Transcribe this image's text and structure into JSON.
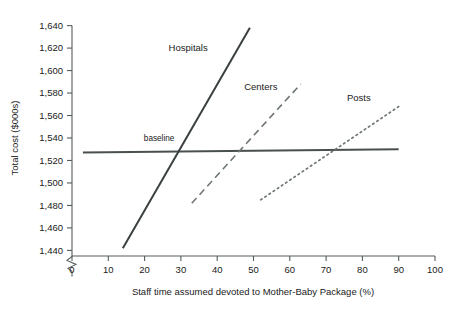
{
  "chart_data": {
    "type": "line",
    "title": "",
    "xlabel": "Staff time assumed devoted to Mother-Baby Package (%)",
    "ylabel": "Total cost ($000s)",
    "xlim": [
      0,
      100
    ],
    "ylim": [
      1435,
      1645
    ],
    "y_axis_break": true,
    "grid": false,
    "legend": "inline-labels",
    "xticks": [
      0,
      10,
      20,
      30,
      40,
      50,
      60,
      70,
      80,
      90,
      100
    ],
    "xtick_labels": [
      "0",
      "10",
      "20",
      "30",
      "40",
      "50",
      "60",
      "70",
      "80",
      "90",
      "100"
    ],
    "yticks": [
      1440,
      1460,
      1480,
      1500,
      1520,
      1540,
      1560,
      1580,
      1600,
      1620,
      1640
    ],
    "ytick_labels": [
      "1,440",
      "1,460",
      "1,480",
      "1,500",
      "1,520",
      "1,540",
      "1,560",
      "1,580",
      "1,600",
      "1,620",
      "1,640"
    ],
    "series": [
      {
        "name": "baseline",
        "style": "solid",
        "color": "#4a5050",
        "x": [
          3,
          90
        ],
        "y": [
          1527,
          1530
        ],
        "label_x": 24,
        "label_y": 1537
      },
      {
        "name": "Hospitals",
        "style": "solid",
        "color": "#3a4040",
        "x": [
          14,
          49
        ],
        "y": [
          1442,
          1638
        ],
        "label_x": 32,
        "label_y": 1617
      },
      {
        "name": "Centers",
        "style": "dashed",
        "color": "#6e7676",
        "x": [
          33,
          63
        ],
        "y": [
          1482,
          1588
        ],
        "label_x": 52,
        "label_y": 1583
      },
      {
        "name": "Posts",
        "style": "dotted",
        "color": "#6e7676",
        "x": [
          52,
          90
        ],
        "y": [
          1485,
          1568
        ],
        "label_x": 79,
        "label_y": 1573
      }
    ],
    "annotations": [
      {
        "text": "baseline",
        "x": 24,
        "y": 1537
      },
      {
        "text": "Hospitals",
        "x": 32,
        "y": 1617
      },
      {
        "text": "Centers",
        "x": 52,
        "y": 1583
      },
      {
        "text": "Posts",
        "x": 79,
        "y": 1573
      }
    ]
  }
}
